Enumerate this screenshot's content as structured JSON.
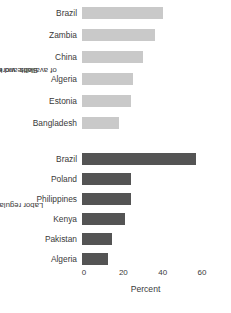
{
  "chart_data": {
    "type": "bar",
    "orientation": "horizontal",
    "title": "",
    "xlabel": "Percent",
    "ylabel": "",
    "xlim": [
      0,
      60
    ],
    "xticks": [
      0,
      20,
      40,
      60
    ],
    "xtick_labels": [
      "0",
      "20",
      "40",
      "60"
    ],
    "grid": false,
    "legend": "none",
    "colors": {
      "skills_bar": "#c9c9c9",
      "labor_bar": "#545454",
      "text": "#3a3a3a",
      "background": "#ffffff"
    },
    "panels": [
      {
        "id": "skills",
        "group_label_line1": "Skills and education",
        "group_label_line2": "of available workers",
        "color": "#c9c9c9",
        "categories": [
          "Brazil",
          "Zambia",
          "China",
          "Algeria",
          "Estonia",
          "Bangladesh"
        ],
        "values": [
          41,
          37,
          31,
          26,
          25,
          19
        ]
      },
      {
        "id": "labor",
        "group_label_line1": "Labor regulations",
        "group_label_line2": "",
        "color": "#545454",
        "categories": [
          "Brazil",
          "Poland",
          "Philippines",
          "Kenya",
          "Pakistan",
          "Algeria"
        ],
        "values": [
          58,
          25,
          25,
          22,
          15,
          13
        ]
      }
    ]
  }
}
